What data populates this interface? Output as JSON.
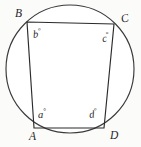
{
  "figure": {
    "kind": "cyclic-quadrilateral-in-circle",
    "background_color": "#fbfbfa",
    "stroke_color": "#2b2b2b",
    "circle": {
      "center_x": 70,
      "center_y": 69,
      "radius": 64,
      "fill_color": "#ffffff"
    },
    "vertices": [
      {
        "id": "B",
        "label": "B",
        "x": 27,
        "y": 22
      },
      {
        "id": "C",
        "label": "C",
        "x": 114,
        "y": 24
      },
      {
        "id": "D",
        "label": "D",
        "x": 104,
        "y": 128
      },
      {
        "id": "A",
        "label": "A",
        "x": 34,
        "y": 128
      }
    ],
    "angle_labels": [
      {
        "id": "b",
        "letter": "b",
        "degree_symbol": "°",
        "at_vertex": "B"
      },
      {
        "id": "c",
        "letter": "c",
        "degree_symbol": "°",
        "at_vertex": "C"
      },
      {
        "id": "a",
        "letter": "a",
        "degree_symbol": "°",
        "at_vertex": "A"
      },
      {
        "id": "d",
        "letter": "d",
        "degree_symbol": "°",
        "at_vertex": "D"
      }
    ],
    "polygon_points": "27,22 114,24 104,128 34,128"
  }
}
